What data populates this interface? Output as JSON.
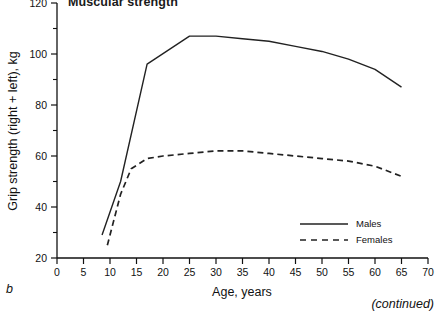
{
  "figure": {
    "title": "Muscular strength",
    "panel_letter": "b",
    "continued_note": "(continued)"
  },
  "legend": {
    "position": "bottom-right",
    "entries": [
      {
        "label": "Males",
        "style": "solid"
      },
      {
        "label": "Females",
        "style": "dashed"
      }
    ]
  },
  "chart_data": {
    "type": "line",
    "title": "Muscular strength",
    "xlabel": "Age, years",
    "ylabel": "Grip strength (right + left), kg",
    "xlim": [
      0,
      70
    ],
    "ylim": [
      20,
      120
    ],
    "xticks": [
      0,
      5,
      10,
      15,
      20,
      25,
      30,
      35,
      40,
      45,
      50,
      55,
      60,
      65,
      70
    ],
    "xtick_labels": [
      "0",
      "5",
      "10",
      "15",
      "20",
      "25",
      "30",
      "35",
      "40",
      "45",
      "50",
      "55",
      "60",
      "65",
      "70"
    ],
    "yticks": [
      20,
      40,
      60,
      80,
      100,
      120
    ],
    "ytick_labels": [
      "20",
      "40",
      "60",
      "80",
      "100",
      "120"
    ],
    "yminorticks": [
      30,
      50,
      70,
      90,
      110
    ],
    "grid": false,
    "series": [
      {
        "name": "Males",
        "style": "solid",
        "color": "#222222",
        "x": [
          8.5,
          12,
          17,
          25,
          30,
          35,
          40,
          45,
          50,
          55,
          60,
          65
        ],
        "values": [
          29,
          50,
          96,
          107,
          107,
          106,
          105,
          103,
          101,
          98,
          94,
          87
        ]
      },
      {
        "name": "Females",
        "style": "dashed",
        "color": "#222222",
        "x": [
          9.5,
          12,
          14,
          17,
          20,
          25,
          30,
          35,
          40,
          45,
          50,
          55,
          60,
          65
        ],
        "values": [
          25,
          45,
          55,
          59,
          60,
          61,
          62,
          62,
          61,
          60,
          59,
          58,
          56,
          52
        ]
      }
    ]
  }
}
